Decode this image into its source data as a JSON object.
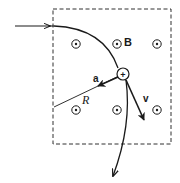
{
  "diagram": {
    "type": "physics-diagram",
    "labels": {
      "field": "B",
      "acceleration": "a",
      "radius": "R",
      "velocity": "v",
      "charge": "+"
    },
    "field_region": {
      "x": 53,
      "y": 9,
      "width": 118,
      "height": 135,
      "border": "dashed"
    },
    "field_symbols": [
      {
        "x": 76,
        "y": 44
      },
      {
        "x": 117,
        "y": 44
      },
      {
        "x": 157,
        "y": 44
      },
      {
        "x": 76,
        "y": 110
      },
      {
        "x": 117,
        "y": 110
      },
      {
        "x": 157,
        "y": 110
      }
    ],
    "field_symbol_meaning": "dot-in-circle (field out of page)",
    "charge_position": {
      "x": 123,
      "y": 74
    },
    "colors": {
      "ink": "#1a1a1a",
      "background": "#ffffff"
    }
  }
}
